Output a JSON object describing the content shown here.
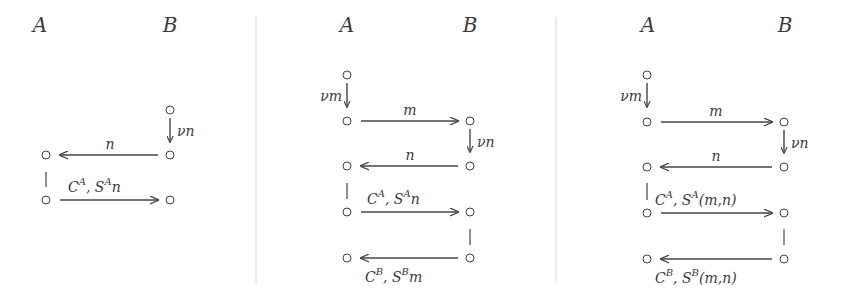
{
  "diagram": {
    "type": "message-sequence-protocol-diagrams",
    "separator_color": "#d6d6d6",
    "line_color": "#444444",
    "panels": [
      {
        "id": "panel-1",
        "parties": [
          "A",
          "B"
        ],
        "steps": [
          {
            "kind": "fresh",
            "party": "B",
            "label": "νn"
          },
          {
            "kind": "message",
            "from": "B",
            "to": "A",
            "label": "n"
          },
          {
            "kind": "message",
            "from": "A",
            "to": "B",
            "label": "C^A, S^A n",
            "label_parts": [
              "C",
              "A",
              ", S",
              "A",
              "n"
            ]
          }
        ]
      },
      {
        "id": "panel-2",
        "parties": [
          "A",
          "B"
        ],
        "steps": [
          {
            "kind": "fresh",
            "party": "A",
            "label": "νm"
          },
          {
            "kind": "message",
            "from": "A",
            "to": "B",
            "label": "m"
          },
          {
            "kind": "fresh",
            "party": "B",
            "label": "νn"
          },
          {
            "kind": "message",
            "from": "B",
            "to": "A",
            "label": "n"
          },
          {
            "kind": "message",
            "from": "A",
            "to": "B",
            "label": "C^A, S^A n",
            "label_parts": [
              "C",
              "A",
              ", S",
              "A",
              "n"
            ]
          },
          {
            "kind": "message",
            "from": "B",
            "to": "A",
            "label": "C^B, S^B m",
            "label_parts": [
              "C",
              "B",
              ", S",
              "B",
              "m"
            ]
          }
        ]
      },
      {
        "id": "panel-3",
        "parties": [
          "A",
          "B"
        ],
        "steps": [
          {
            "kind": "fresh",
            "party": "A",
            "label": "νm"
          },
          {
            "kind": "message",
            "from": "A",
            "to": "B",
            "label": "m"
          },
          {
            "kind": "fresh",
            "party": "B",
            "label": "νn"
          },
          {
            "kind": "message",
            "from": "B",
            "to": "A",
            "label": "n"
          },
          {
            "kind": "message",
            "from": "A",
            "to": "B",
            "label": "C^A, S^A(m,n)",
            "label_parts": [
              "C",
              "A",
              ", S",
              "A",
              "(m,n)"
            ]
          },
          {
            "kind": "message",
            "from": "B",
            "to": "A",
            "label": "C^B, S^B(m,n)",
            "label_parts": [
              "C",
              "B",
              ", S",
              "B",
              "(m,n)"
            ]
          }
        ]
      }
    ]
  },
  "labels": {
    "p1": {
      "hdr_a": "A",
      "hdr_b": "B",
      "fresh_b": "νn",
      "msg_n": "n",
      "msg3_c": "C",
      "msg3_csup": "A",
      "msg3_s": ", S",
      "msg3_ssup": "A",
      "msg3_tail": "n"
    },
    "p2": {
      "hdr_a": "A",
      "hdr_b": "B",
      "fresh_a": "νm",
      "msg_m": "m",
      "fresh_b": "νn",
      "msg_n": "n",
      "msg3_c": "C",
      "msg3_csup": "A",
      "msg3_s": ", S",
      "msg3_ssup": "A",
      "msg3_tail": "n",
      "msg4_c": "C",
      "msg4_csup": "B",
      "msg4_s": ", S",
      "msg4_ssup": "B",
      "msg4_tail": "m"
    },
    "p3": {
      "hdr_a": "A",
      "hdr_b": "B",
      "fresh_a": "νm",
      "msg_m": "m",
      "fresh_b": "νn",
      "msg_n": "n",
      "msg3_c": "C",
      "msg3_csup": "A",
      "msg3_s": ", S",
      "msg3_ssup": "A",
      "msg3_tail": "(m,n)",
      "msg4_c": "C",
      "msg4_csup": "B",
      "msg4_s": ", S",
      "msg4_ssup": "B",
      "msg4_tail": "(m,n)"
    }
  }
}
